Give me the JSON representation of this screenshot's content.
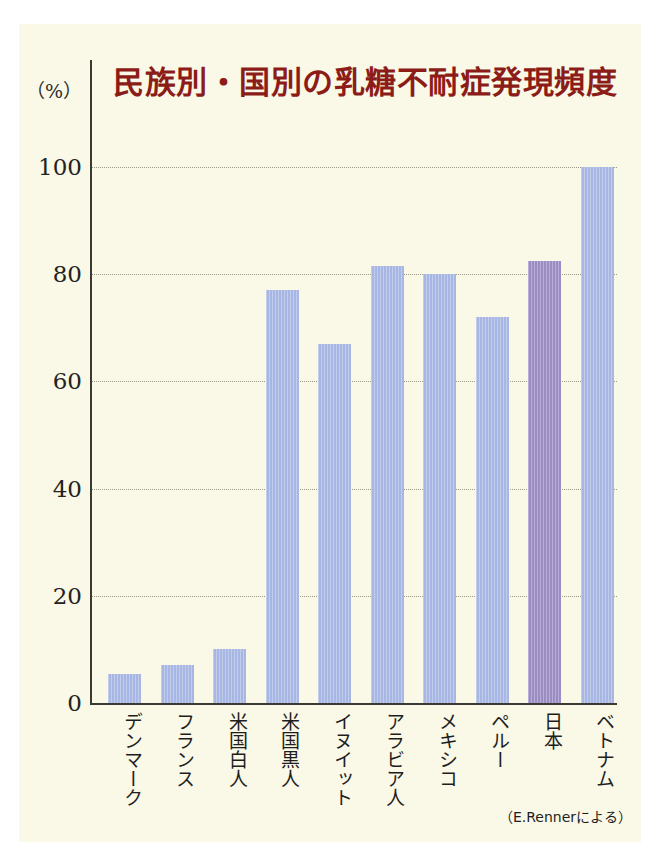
{
  "figure": {
    "background_color": "#ffffff",
    "panel_color": "#faf8e6"
  },
  "title": "民族別・国別の乳糖不耐症発現頻度",
  "unit_label": "（%）",
  "source_note": "（E.Rennerによる）",
  "colors": {
    "title": "#8c1c18",
    "bar_default": "#a8b6e3",
    "bar_highlight": "#9b8cc4",
    "axis": "#3a3a33",
    "gridline": "#9a9a86"
  },
  "chart_data": {
    "type": "bar",
    "title": "民族別・国別の乳糖不耐症発現頻度",
    "xlabel": "",
    "ylabel": "（%）",
    "ylim": [
      0,
      100
    ],
    "yticks": [
      0,
      20,
      40,
      60,
      80,
      100
    ],
    "ytick_labels": [
      "0",
      "20",
      "40",
      "60",
      "80",
      "100"
    ],
    "grid": true,
    "legend": "none",
    "categories": [
      "デンマーク",
      "フランス",
      "米国白人",
      "米国黒人",
      "イヌイット",
      "アラビア人",
      "メキシコ",
      "ペルー",
      "日本",
      "ベトナム"
    ],
    "values": [
      5.5,
      7,
      10,
      77,
      67,
      81.5,
      80,
      72,
      82.5,
      100
    ],
    "bar_colors": [
      "#a8b6e3",
      "#a8b6e3",
      "#a8b6e3",
      "#a8b6e3",
      "#a8b6e3",
      "#a8b6e3",
      "#a8b6e3",
      "#a8b6e3",
      "#9b8cc4",
      "#a8b6e3"
    ],
    "highlighted_category": "日本",
    "annotation": "（E.Rennerによる）"
  }
}
